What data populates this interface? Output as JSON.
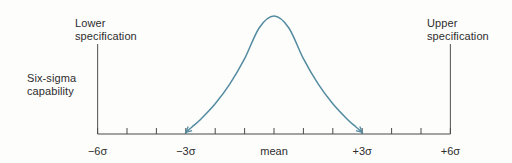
{
  "colors": {
    "background": "#fdfdfc",
    "curve": "#538ba0",
    "axis": "#4a4a4a",
    "spec_line": "#606060",
    "text": "#2d2d2d"
  },
  "labels": {
    "lower_spec": {
      "line1": "Lower",
      "line2": "specification"
    },
    "upper_spec": {
      "line1": "Upper",
      "line2": "specification"
    },
    "capability": {
      "line1": "Six-sigma",
      "line2": "capability"
    }
  },
  "axis": {
    "tick_sigmas": [
      -6,
      -5,
      -4,
      -3,
      -2,
      -1,
      0,
      1,
      2,
      3,
      4,
      5,
      6
    ],
    "tick_labels": [
      {
        "sigma": -6,
        "text": "−6σ"
      },
      {
        "sigma": -3,
        "text": "−3σ"
      },
      {
        "sigma": 0,
        "text": "mean"
      },
      {
        "sigma": 3,
        "text": "+3σ"
      },
      {
        "sigma": 6,
        "text": "+6σ"
      }
    ]
  },
  "chart_data": {
    "type": "line",
    "title": "",
    "x_tick_labels": [
      "−6σ",
      "−3σ",
      "mean",
      "+3σ",
      "+6σ"
    ],
    "curve_span_sigma": [
      -3,
      3
    ],
    "spec_limits_sigma": [
      -6,
      6
    ],
    "curve_profile": [
      [
        -3.0,
        0.005
      ],
      [
        -2.8,
        0.05
      ],
      [
        -2.5,
        0.115
      ],
      [
        -2.0,
        0.25
      ],
      [
        -1.5,
        0.42
      ],
      [
        -1.0,
        0.635
      ],
      [
        -0.5,
        0.9
      ],
      [
        0.0,
        1.0
      ],
      [
        0.5,
        0.9
      ],
      [
        1.0,
        0.635
      ],
      [
        1.5,
        0.42
      ],
      [
        2.0,
        0.25
      ],
      [
        2.5,
        0.115
      ],
      [
        2.8,
        0.05
      ],
      [
        3.0,
        0.005
      ]
    ]
  }
}
